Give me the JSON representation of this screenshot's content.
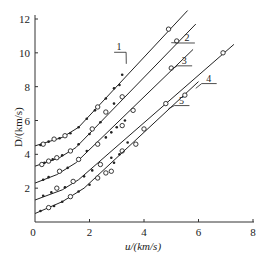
{
  "chart_data": {
    "type": "line",
    "title": "",
    "xlabel": "u/(km/s)",
    "ylabel": "D/(km/s)",
    "xlim": [
      0,
      8
    ],
    "ylim": [
      0,
      12
    ],
    "x_ticks": [
      0,
      2,
      4,
      6,
      8
    ],
    "y_ticks": [
      0,
      2,
      4,
      6,
      8,
      10,
      12
    ],
    "grid": false,
    "legend": "inline numeric labels 1-5 on each line",
    "series": [
      {
        "name": "1",
        "line": [
          [
            0,
            4.5
          ],
          [
            1.0,
            5.0
          ],
          [
            1.6,
            5.6
          ],
          [
            5.6,
            12.5
          ]
        ],
        "points_open": [
          [
            0.3,
            4.6
          ],
          [
            0.7,
            4.9
          ],
          [
            1.1,
            5.1
          ],
          [
            2.3,
            6.8
          ],
          [
            4.9,
            11.4
          ]
        ],
        "points_filled": [
          [
            0.2,
            4.55
          ],
          [
            0.5,
            4.75
          ],
          [
            0.9,
            4.95
          ],
          [
            1.3,
            5.25
          ],
          [
            1.6,
            5.6
          ],
          [
            1.9,
            6.1
          ],
          [
            2.2,
            6.6
          ],
          [
            2.6,
            7.3
          ],
          [
            2.9,
            7.9
          ],
          [
            3.1,
            8.1
          ]
        ]
      },
      {
        "name": "2",
        "line": [
          [
            0,
            3.3
          ],
          [
            0.9,
            3.8
          ],
          [
            1.5,
            4.4
          ],
          [
            5.9,
            11.7
          ]
        ],
        "points_open": [
          [
            0.25,
            3.4
          ],
          [
            0.5,
            3.6
          ],
          [
            0.8,
            3.8
          ],
          [
            1.3,
            4.2
          ],
          [
            2.1,
            5.5
          ],
          [
            2.6,
            6.5
          ],
          [
            3.2,
            7.4
          ],
          [
            5.2,
            10.7
          ]
        ],
        "points_filled": [
          [
            0.35,
            3.5
          ],
          [
            0.65,
            3.7
          ],
          [
            1.0,
            3.95
          ],
          [
            1.6,
            4.6
          ],
          [
            2.0,
            5.2
          ],
          [
            2.4,
            5.9
          ],
          [
            2.9,
            7.0
          ],
          [
            3.2,
            8.7
          ]
        ]
      },
      {
        "name": "3",
        "line": [
          [
            0,
            2.3
          ],
          [
            0.8,
            2.8
          ],
          [
            1.5,
            3.5
          ],
          [
            5.8,
            10.2
          ]
        ],
        "points_open": [
          [
            0.9,
            3.0
          ],
          [
            1.6,
            3.7
          ],
          [
            2.3,
            4.6
          ],
          [
            3.2,
            5.7
          ],
          [
            3.6,
            6.6
          ],
          [
            5.0,
            9.1
          ]
        ],
        "points_filled": [
          [
            0.3,
            2.5
          ],
          [
            0.5,
            2.65
          ],
          [
            1.2,
            3.2
          ],
          [
            1.9,
            4.2
          ],
          [
            2.6,
            5.0
          ],
          [
            2.8,
            5.3
          ],
          [
            3.0,
            5.6
          ],
          [
            3.3,
            6.0
          ]
        ]
      },
      {
        "name": "4",
        "line": [
          [
            0,
            1.3
          ],
          [
            1.0,
            1.9
          ],
          [
            1.6,
            2.5
          ],
          [
            7.3,
            10.5
          ]
        ],
        "points_open": [
          [
            0.8,
            2.0
          ],
          [
            1.4,
            2.4
          ],
          [
            2.4,
            3.4
          ],
          [
            3.2,
            4.2
          ],
          [
            4.0,
            5.5
          ],
          [
            4.8,
            7.0
          ],
          [
            6.9,
            10.0
          ]
        ],
        "points_filled": [
          [
            0.3,
            1.55
          ],
          [
            0.6,
            1.75
          ],
          [
            1.1,
            2.05
          ],
          [
            1.8,
            2.7
          ],
          [
            2.1,
            3.05
          ],
          [
            2.8,
            3.8
          ],
          [
            3.4,
            4.7
          ]
        ]
      },
      {
        "name": "5",
        "line": [
          [
            0,
            0.5
          ],
          [
            1.0,
            1.2
          ],
          [
            1.8,
            2.0
          ],
          [
            6.0,
            8.3
          ]
        ],
        "points_open": [
          [
            0.5,
            0.85
          ],
          [
            1.3,
            1.5
          ],
          [
            2.3,
            2.6
          ],
          [
            2.6,
            2.9
          ],
          [
            2.8,
            3.0
          ],
          [
            3.7,
            4.6
          ],
          [
            5.5,
            7.5
          ]
        ],
        "points_filled": [
          [
            0.2,
            0.65
          ],
          [
            0.7,
            0.95
          ],
          [
            1.0,
            1.2
          ],
          [
            1.6,
            1.8
          ],
          [
            2.0,
            2.2
          ],
          [
            2.9,
            3.5
          ],
          [
            3.1,
            4.0
          ]
        ]
      }
    ],
    "line_labels": [
      {
        "text": "1",
        "anchor": [
          3.35,
          9.35
        ],
        "label_pos": [
          3.05,
          10.15
        ]
      },
      {
        "text": "2",
        "anchor": [
          5.0,
          10.6
        ],
        "label_pos": [
          5.5,
          10.7
        ]
      },
      {
        "text": "3",
        "anchor": [
          5.0,
          9.0
        ],
        "label_pos": [
          5.4,
          9.35
        ]
      },
      {
        "text": "4",
        "anchor": [
          5.9,
          7.9
        ],
        "label_pos": [
          6.3,
          8.3
        ]
      },
      {
        "text": "5",
        "anchor": [
          4.9,
          6.7
        ],
        "label_pos": [
          5.3,
          7.0
        ]
      }
    ]
  },
  "axes": {
    "x_label": "u/(km/s)",
    "y_label": "D/(km/s)",
    "x_tick_labels": [
      "0",
      "2",
      "4",
      "6",
      "8"
    ],
    "y_tick_labels": [
      "2",
      "4",
      "6",
      "8",
      "10",
      "12"
    ]
  }
}
